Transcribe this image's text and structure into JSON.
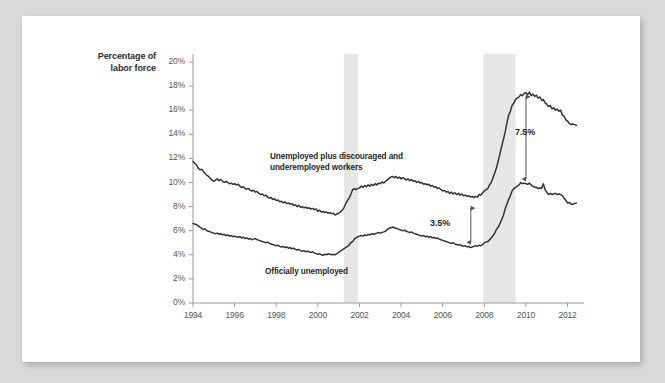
{
  "page": {
    "background_color": "#d9d9d9",
    "sheet_color": "#ffffff"
  },
  "chart_data": {
    "type": "line",
    "title": "",
    "xlabel": "",
    "ylabel": "Percentage of labor force",
    "ylabel_line1": "Percentage of",
    "ylabel_line2": "labor force",
    "xlim": [
      1994,
      2012.5
    ],
    "ylim": [
      0,
      20
    ],
    "grid": false,
    "legend_position": "inline-annotation",
    "line_color": "#333333",
    "recession_band_color": "#e6e6e6",
    "axis_color": "#9a9a9a",
    "tick_label_color": "#55565a",
    "ytick_labels": [
      "0%",
      "2%",
      "4%",
      "6%",
      "8%",
      "10%",
      "12%",
      "14%",
      "16%",
      "18%",
      "20%"
    ],
    "ytick_values": [
      0,
      2,
      4,
      6,
      8,
      10,
      12,
      14,
      16,
      18,
      20
    ],
    "xtick_labels": [
      "1994",
      "1996",
      "1998",
      "2000",
      "2002",
      "2004",
      "2006",
      "2008",
      "2010",
      "2012"
    ],
    "xtick_values": [
      1994,
      1996,
      1998,
      2000,
      2002,
      2004,
      2006,
      2008,
      2010,
      2012
    ],
    "recession_bands": [
      {
        "name": "recession-2001",
        "start": 2001.25,
        "end": 2001.92
      },
      {
        "name": "recession-2008",
        "start": 2007.95,
        "end": 2009.5
      }
    ],
    "annotations": [
      {
        "name": "gap-small",
        "label": "3.5%",
        "x": 2007.35,
        "y_top": 8.2,
        "y_bottom": 4.7
      },
      {
        "name": "gap-large",
        "label": "7.5%",
        "x": 2010.0,
        "y_top": 17.45,
        "y_bottom": 9.95
      }
    ],
    "series": [
      {
        "name": "Unemployed plus discouraged and underemployed workers",
        "label_line1": "Unemployed plus discouraged and",
        "label_line2": "underemployed workers",
        "x": [
          1994.0,
          1994.08,
          1994.17,
          1994.25,
          1994.33,
          1994.42,
          1994.5,
          1994.58,
          1994.67,
          1994.75,
          1994.83,
          1994.92,
          1995.0,
          1995.08,
          1995.17,
          1995.25,
          1995.33,
          1995.42,
          1995.5,
          1995.58,
          1995.67,
          1995.75,
          1995.83,
          1995.92,
          1996.0,
          1996.08,
          1996.17,
          1996.25,
          1996.33,
          1996.42,
          1996.5,
          1996.58,
          1996.67,
          1996.75,
          1996.83,
          1996.92,
          1997.0,
          1997.08,
          1997.17,
          1997.25,
          1997.33,
          1997.42,
          1997.5,
          1997.58,
          1997.67,
          1997.75,
          1997.83,
          1997.92,
          1998.0,
          1998.08,
          1998.17,
          1998.25,
          1998.33,
          1998.42,
          1998.5,
          1998.58,
          1998.67,
          1998.75,
          1998.83,
          1998.92,
          1999.0,
          1999.08,
          1999.17,
          1999.25,
          1999.33,
          1999.42,
          1999.5,
          1999.58,
          1999.67,
          1999.75,
          1999.83,
          1999.92,
          2000.0,
          2000.08,
          2000.17,
          2000.25,
          2000.33,
          2000.42,
          2000.5,
          2000.58,
          2000.67,
          2000.75,
          2000.83,
          2000.92,
          2001.0,
          2001.08,
          2001.17,
          2001.25,
          2001.33,
          2001.42,
          2001.5,
          2001.58,
          2001.67,
          2001.75,
          2001.83,
          2001.92,
          2002.0,
          2002.08,
          2002.17,
          2002.25,
          2002.33,
          2002.42,
          2002.5,
          2002.58,
          2002.67,
          2002.75,
          2002.83,
          2002.92,
          2003.0,
          2003.08,
          2003.17,
          2003.25,
          2003.33,
          2003.42,
          2003.5,
          2003.58,
          2003.67,
          2003.75,
          2003.83,
          2003.92,
          2004.0,
          2004.08,
          2004.17,
          2004.25,
          2004.33,
          2004.42,
          2004.5,
          2004.58,
          2004.67,
          2004.75,
          2004.83,
          2004.92,
          2005.0,
          2005.08,
          2005.17,
          2005.25,
          2005.33,
          2005.42,
          2005.5,
          2005.58,
          2005.67,
          2005.75,
          2005.83,
          2005.92,
          2006.0,
          2006.08,
          2006.17,
          2006.25,
          2006.33,
          2006.42,
          2006.5,
          2006.58,
          2006.67,
          2006.75,
          2006.83,
          2006.92,
          2007.0,
          2007.08,
          2007.17,
          2007.25,
          2007.33,
          2007.42,
          2007.5,
          2007.58,
          2007.67,
          2007.75,
          2007.83,
          2007.92,
          2008.0,
          2008.08,
          2008.17,
          2008.25,
          2008.33,
          2008.42,
          2008.5,
          2008.58,
          2008.67,
          2008.75,
          2008.83,
          2008.92,
          2009.0,
          2009.08,
          2009.17,
          2009.25,
          2009.33,
          2009.42,
          2009.5,
          2009.58,
          2009.67,
          2009.75,
          2009.83,
          2009.92,
          2010.0,
          2010.08,
          2010.17,
          2010.25,
          2010.33,
          2010.42,
          2010.5,
          2010.58,
          2010.67,
          2010.75,
          2010.83,
          2010.92,
          2011.0,
          2011.08,
          2011.17,
          2011.25,
          2011.33,
          2011.42,
          2011.5,
          2011.58,
          2011.67,
          2011.75,
          2011.83,
          2011.92,
          2012.0,
          2012.08,
          2012.17,
          2012.25,
          2012.33,
          2012.42
        ],
        "y": [
          11.75,
          11.6,
          11.45,
          11.2,
          11.05,
          11.1,
          10.9,
          10.75,
          10.6,
          10.5,
          10.35,
          10.2,
          10.1,
          10.2,
          10.3,
          10.15,
          10.25,
          10.1,
          10.0,
          10.1,
          10.0,
          9.9,
          9.95,
          9.85,
          9.9,
          9.8,
          9.85,
          9.7,
          9.6,
          9.65,
          9.5,
          9.45,
          9.5,
          9.35,
          9.3,
          9.35,
          9.2,
          9.25,
          9.1,
          9.0,
          9.05,
          8.9,
          8.95,
          8.8,
          8.7,
          8.75,
          8.6,
          8.65,
          8.5,
          8.55,
          8.4,
          8.45,
          8.3,
          8.4,
          8.25,
          8.3,
          8.2,
          8.25,
          8.1,
          8.15,
          8.0,
          8.1,
          7.95,
          8.0,
          7.9,
          7.95,
          7.85,
          7.9,
          7.8,
          7.85,
          7.75,
          7.8,
          7.6,
          7.7,
          7.55,
          7.6,
          7.5,
          7.55,
          7.45,
          7.5,
          7.4,
          7.45,
          7.3,
          7.4,
          7.45,
          7.55,
          7.7,
          7.9,
          8.2,
          8.5,
          8.7,
          9.0,
          9.4,
          9.5,
          9.4,
          9.5,
          9.55,
          9.7,
          9.6,
          9.75,
          9.65,
          9.8,
          9.7,
          9.85,
          9.75,
          9.9,
          9.8,
          9.95,
          9.9,
          10.05,
          9.95,
          10.1,
          10.2,
          10.35,
          10.45,
          10.5,
          10.4,
          10.5,
          10.35,
          10.45,
          10.3,
          10.4,
          10.3,
          10.2,
          10.3,
          10.15,
          10.25,
          10.1,
          10.15,
          10.0,
          10.1,
          9.95,
          10.0,
          9.85,
          9.9,
          9.8,
          9.85,
          9.7,
          9.75,
          9.6,
          9.65,
          9.5,
          9.55,
          9.4,
          9.3,
          9.35,
          9.2,
          9.25,
          9.1,
          9.2,
          9.05,
          9.15,
          9.0,
          9.1,
          8.95,
          9.05,
          8.9,
          8.95,
          8.85,
          8.9,
          8.8,
          8.85,
          8.75,
          8.85,
          8.8,
          9.0,
          8.95,
          9.15,
          9.3,
          9.4,
          9.5,
          9.8,
          10.0,
          10.4,
          10.8,
          11.2,
          11.8,
          12.4,
          13.0,
          13.6,
          14.2,
          14.9,
          15.6,
          15.9,
          16.4,
          16.6,
          16.9,
          17.0,
          17.1,
          17.3,
          17.2,
          17.4,
          17.45,
          17.3,
          17.5,
          17.2,
          17.35,
          17.15,
          17.25,
          17.0,
          17.1,
          16.8,
          16.9,
          16.6,
          16.5,
          16.3,
          16.4,
          16.1,
          16.2,
          16.0,
          16.1,
          15.9,
          16.0,
          15.6,
          15.5,
          15.2,
          15.1,
          14.9,
          14.8,
          14.85,
          14.8,
          14.75
        ]
      },
      {
        "name": "Officially unemployed",
        "label_line1": "Officially unemployed",
        "x": [
          1994.0,
          1994.08,
          1994.17,
          1994.25,
          1994.33,
          1994.42,
          1994.5,
          1994.58,
          1994.67,
          1994.75,
          1994.83,
          1994.92,
          1995.0,
          1995.08,
          1995.17,
          1995.25,
          1995.33,
          1995.42,
          1995.5,
          1995.58,
          1995.67,
          1995.75,
          1995.83,
          1995.92,
          1996.0,
          1996.08,
          1996.17,
          1996.25,
          1996.33,
          1996.42,
          1996.5,
          1996.58,
          1996.67,
          1996.75,
          1996.83,
          1996.92,
          1997.0,
          1997.08,
          1997.17,
          1997.25,
          1997.33,
          1997.42,
          1997.5,
          1997.58,
          1997.67,
          1997.75,
          1997.83,
          1997.92,
          1998.0,
          1998.08,
          1998.17,
          1998.25,
          1998.33,
          1998.42,
          1998.5,
          1998.58,
          1998.67,
          1998.75,
          1998.83,
          1998.92,
          1999.0,
          1999.08,
          1999.17,
          1999.25,
          1999.33,
          1999.42,
          1999.5,
          1999.58,
          1999.67,
          1999.75,
          1999.83,
          1999.92,
          2000.0,
          2000.08,
          2000.17,
          2000.25,
          2000.33,
          2000.42,
          2000.5,
          2000.58,
          2000.67,
          2000.75,
          2000.83,
          2000.92,
          2001.0,
          2001.08,
          2001.17,
          2001.25,
          2001.33,
          2001.42,
          2001.5,
          2001.58,
          2001.67,
          2001.75,
          2001.83,
          2001.92,
          2002.0,
          2002.08,
          2002.17,
          2002.25,
          2002.33,
          2002.42,
          2002.5,
          2002.58,
          2002.67,
          2002.75,
          2002.83,
          2002.92,
          2003.0,
          2003.08,
          2003.17,
          2003.25,
          2003.33,
          2003.42,
          2003.5,
          2003.58,
          2003.67,
          2003.75,
          2003.83,
          2003.92,
          2004.0,
          2004.08,
          2004.17,
          2004.25,
          2004.33,
          2004.42,
          2004.5,
          2004.58,
          2004.67,
          2004.75,
          2004.83,
          2004.92,
          2005.0,
          2005.08,
          2005.17,
          2005.25,
          2005.33,
          2005.42,
          2005.5,
          2005.58,
          2005.67,
          2005.75,
          2005.83,
          2005.92,
          2006.0,
          2006.08,
          2006.17,
          2006.25,
          2006.33,
          2006.42,
          2006.5,
          2006.58,
          2006.67,
          2006.75,
          2006.83,
          2006.92,
          2007.0,
          2007.08,
          2007.17,
          2007.25,
          2007.33,
          2007.42,
          2007.5,
          2007.58,
          2007.67,
          2007.75,
          2007.83,
          2007.92,
          2008.0,
          2008.08,
          2008.17,
          2008.25,
          2008.33,
          2008.42,
          2008.5,
          2008.58,
          2008.67,
          2008.75,
          2008.83,
          2008.92,
          2009.0,
          2009.08,
          2009.17,
          2009.25,
          2009.33,
          2009.42,
          2009.5,
          2009.58,
          2009.67,
          2009.75,
          2009.83,
          2009.92,
          2010.0,
          2010.08,
          2010.17,
          2010.25,
          2010.33,
          2010.42,
          2010.5,
          2010.58,
          2010.67,
          2010.75,
          2010.83,
          2010.92,
          2011.0,
          2011.08,
          2011.17,
          2011.25,
          2011.33,
          2011.42,
          2011.5,
          2011.58,
          2011.67,
          2011.75,
          2011.83,
          2011.92,
          2012.0,
          2012.08,
          2012.17,
          2012.25,
          2012.33,
          2012.42
        ],
        "y": [
          6.6,
          6.55,
          6.5,
          6.4,
          6.3,
          6.2,
          6.1,
          6.15,
          6.0,
          5.95,
          5.9,
          5.85,
          5.8,
          5.75,
          5.8,
          5.7,
          5.75,
          5.65,
          5.7,
          5.6,
          5.65,
          5.55,
          5.6,
          5.5,
          5.55,
          5.5,
          5.45,
          5.5,
          5.4,
          5.45,
          5.35,
          5.4,
          5.3,
          5.35,
          5.25,
          5.3,
          5.35,
          5.25,
          5.2,
          5.15,
          5.1,
          5.05,
          5.0,
          5.05,
          4.95,
          4.9,
          4.85,
          4.8,
          4.75,
          4.8,
          4.7,
          4.65,
          4.7,
          4.6,
          4.65,
          4.55,
          4.6,
          4.5,
          4.55,
          4.45,
          4.4,
          4.45,
          4.35,
          4.3,
          4.35,
          4.25,
          4.3,
          4.25,
          4.2,
          4.25,
          4.15,
          4.1,
          4.05,
          4.1,
          4.0,
          3.95,
          4.05,
          4.0,
          4.1,
          4.05,
          4.0,
          4.05,
          4.0,
          4.1,
          4.2,
          4.3,
          4.4,
          4.5,
          4.6,
          4.7,
          4.8,
          5.0,
          5.1,
          5.3,
          5.4,
          5.5,
          5.55,
          5.6,
          5.55,
          5.65,
          5.6,
          5.7,
          5.65,
          5.75,
          5.7,
          5.75,
          5.8,
          5.85,
          5.8,
          5.85,
          5.9,
          5.95,
          6.1,
          6.2,
          6.25,
          6.3,
          6.25,
          6.2,
          6.15,
          6.1,
          6.05,
          6.0,
          6.05,
          5.95,
          5.9,
          5.85,
          5.9,
          5.8,
          5.75,
          5.7,
          5.65,
          5.6,
          5.55,
          5.6,
          5.5,
          5.55,
          5.45,
          5.5,
          5.4,
          5.45,
          5.35,
          5.4,
          5.3,
          5.25,
          5.2,
          5.15,
          5.1,
          5.05,
          5.0,
          4.95,
          5.0,
          4.9,
          4.85,
          4.8,
          4.85,
          4.75,
          4.7,
          4.75,
          4.65,
          4.7,
          4.6,
          4.65,
          4.7,
          4.75,
          4.7,
          4.8,
          4.75,
          4.85,
          5.0,
          5.05,
          5.1,
          5.25,
          5.4,
          5.6,
          5.8,
          6.1,
          6.3,
          6.6,
          6.9,
          7.3,
          7.8,
          8.2,
          8.6,
          8.9,
          9.3,
          9.5,
          9.6,
          9.7,
          9.8,
          10.0,
          9.9,
          9.95,
          9.9,
          9.85,
          9.95,
          9.8,
          9.7,
          9.6,
          9.6,
          9.5,
          9.55,
          9.5,
          9.9,
          9.4,
          9.2,
          9.0,
          9.1,
          9.0,
          9.05,
          9.1,
          9.0,
          9.05,
          9.0,
          8.9,
          8.7,
          8.5,
          8.3,
          8.35,
          8.2,
          8.2,
          8.25,
          8.3
        ]
      }
    ]
  }
}
